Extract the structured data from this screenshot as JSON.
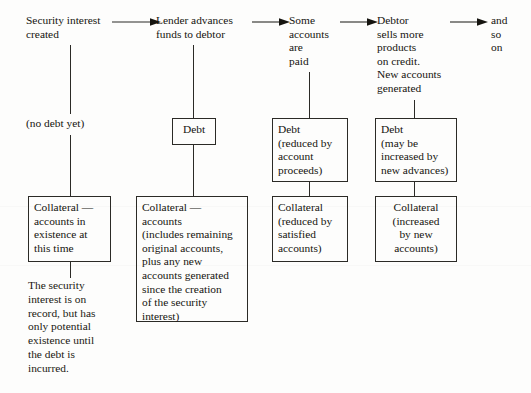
{
  "diagram": {
    "ink_color": "#15140f",
    "line_color": "#2b2a26",
    "background_color": "#fdfdfc",
    "columns": [
      {
        "id": "col1",
        "header": "Security interest\ncreated",
        "note": "(no debt yet)",
        "boxes": [
          {
            "id": "col1-collateral",
            "text": "Collateral —\naccounts in\nexistence at\nthis time"
          }
        ],
        "paragraph": "The security\ninterest is on\nrecord, but has\nonly potential\nexistence until\nthe debt is\nincurred."
      },
      {
        "id": "col2",
        "header": "Lender advances\nfunds to debtor",
        "boxes": [
          {
            "id": "col2-debt",
            "text": "Debt"
          },
          {
            "id": "col2-collateral",
            "text": "Collateral —\naccounts\n(includes remaining\noriginal accounts,\nplus any new\naccounts generated\nsince the creation\nof the security\ninterest)"
          }
        ]
      },
      {
        "id": "col3",
        "header": "Some\naccounts\nare\npaid",
        "boxes": [
          {
            "id": "col3-debt",
            "text": "Debt\n(reduced by\naccount\nproceeds)"
          },
          {
            "id": "col3-collateral",
            "text": "Collateral\n(reduced by\nsatisfied\naccounts)"
          }
        ]
      },
      {
        "id": "col4",
        "header": "Debtor\nsells more\nproducts\non credit.\nNew accounts\ngenerated",
        "boxes": [
          {
            "id": "col4-debt",
            "text": "Debt\n(may be\nincreased by\nnew advances)"
          },
          {
            "id": "col4-collateral",
            "text": "Collateral\n(increased\nby new\naccounts)"
          }
        ]
      },
      {
        "id": "col5",
        "header": "and\nso\non",
        "boxes": []
      }
    ],
    "arrows": [
      {
        "id": "arrow-1-2",
        "from": "col1",
        "to": "col2"
      },
      {
        "id": "arrow-2-3",
        "from": "col2",
        "to": "col3"
      },
      {
        "id": "arrow-3-4",
        "from": "col3",
        "to": "col4"
      },
      {
        "id": "arrow-4-5",
        "from": "col4",
        "to": "col5"
      }
    ]
  }
}
